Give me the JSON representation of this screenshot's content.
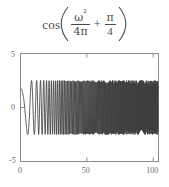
{
  "formula": {
    "function_name": "cos",
    "open_paren": "(",
    "close_paren": ")",
    "term1_numerator": "ω",
    "term1_numerator_exponent": "2",
    "term1_denominator": "4π",
    "operator": "+",
    "term2_numerator": "π",
    "term2_denominator": "4",
    "plain_text": "cos(ω²/(4π) + π/4)"
  },
  "colors": {
    "background": "#ffffff",
    "frame": "#8c8c8c",
    "curve": "#3f3f3f",
    "tick_label": "#6b6b6b",
    "formula_text": "#4a4a4a"
  },
  "chart_data": {
    "type": "line",
    "title": "",
    "subtitle": "",
    "xlabel": "",
    "ylabel": "",
    "xlim": [
      0,
      104
    ],
    "ylim": [
      -5,
      5
    ],
    "xticks": [
      0,
      50,
      100
    ],
    "xtick_labels": [
      "0",
      "50",
      "100"
    ],
    "yticks": [
      -5,
      0,
      5
    ],
    "ytick_labels": [
      "-5",
      "0",
      "5"
    ],
    "grid": false,
    "legend": "none",
    "frame": "box",
    "series": [
      {
        "name": "chirp",
        "expression": "2.5*cos(w^2/(4*pi) + pi/4)",
        "amplitude": 2.5,
        "phase": 0.7853981634,
        "chirp_rate": 0.0795774715,
        "n_points": 1200,
        "x_start": 0,
        "x_end": 104,
        "y_at_x0": 1.77,
        "first_trough_x": 19.0,
        "first_trough_y": -2.5,
        "first_peak_x": 30.0,
        "first_peak_y": 2.5
      }
    ]
  }
}
